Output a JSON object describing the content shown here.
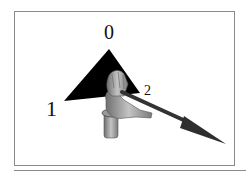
{
  "figure": {
    "labels": {
      "vertex_0": "0",
      "vertex_1": "1",
      "vertex_2": "2"
    },
    "colors": {
      "triangle": "#000000",
      "arrow": "#3a3a3a",
      "hand": "#9a9a9a",
      "frame": "#8a8a8a"
    },
    "elements": [
      "triangle",
      "hand",
      "arrow"
    ]
  }
}
